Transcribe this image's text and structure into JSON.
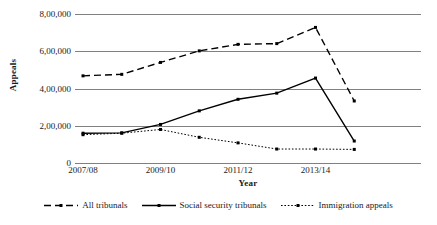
{
  "chart_data": {
    "type": "line",
    "title": "",
    "xlabel": "Year",
    "ylabel": "Appeals",
    "categories": [
      "2007/08",
      "2008/09",
      "2009/10",
      "2010/11",
      "2011/12",
      "2012/13",
      "2013/14",
      "2014/15",
      "2015/16"
    ],
    "tick_labels_shown": [
      "2007/08",
      "2009/10",
      "2011/12",
      "2013/14"
    ],
    "ylim": [
      0,
      800000
    ],
    "yticks": [
      0,
      200000,
      400000,
      600000,
      800000
    ],
    "ytick_labels": [
      "0",
      "2,00,000",
      "4,00,000",
      "6,00,000",
      "8,00,000"
    ],
    "grid": true,
    "legend_position": "bottom",
    "series": [
      {
        "name": "All tribunals",
        "style": "dashed",
        "color": "#000000",
        "values": [
          468000,
          476000,
          540000,
          602000,
          637000,
          641000,
          728000,
          333000,
          null
        ]
      },
      {
        "name": "Social security tribunals",
        "style": "solid",
        "color": "#000000",
        "values": [
          160000,
          162000,
          207000,
          280000,
          342000,
          375000,
          456000,
          118000,
          null
        ]
      },
      {
        "name": "Immigration appeals",
        "style": "dotted",
        "color": "#000000",
        "values": [
          152000,
          160000,
          180000,
          138000,
          108000,
          75000,
          75000,
          73000,
          null
        ]
      }
    ]
  },
  "axes": {
    "y_title": "Appeals",
    "x_title": "Year"
  },
  "legend": {
    "items": [
      {
        "label": "All tribunals",
        "icon": "dashed-line-marker-icon"
      },
      {
        "label": "Social security tribunals",
        "icon": "solid-line-marker-icon"
      },
      {
        "label": "Immigration appeals",
        "icon": "dotted-line-marker-icon"
      }
    ]
  },
  "colors": {
    "line": "#000000",
    "grid": "#808080",
    "background": "#ffffff"
  }
}
